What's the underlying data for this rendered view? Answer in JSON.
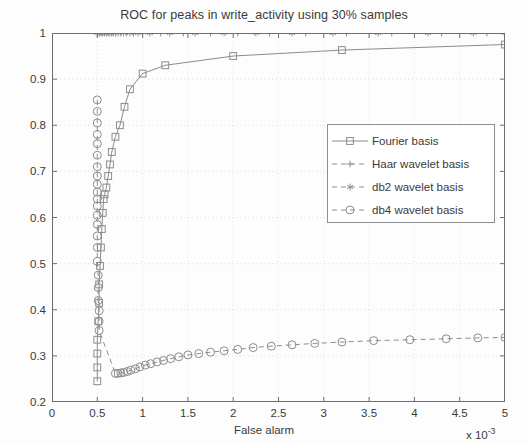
{
  "chart_data": {
    "type": "line",
    "title": "ROC for peaks in write_activity using 30% samples",
    "xlabel": "False alarm",
    "ylabel": "Hit rate",
    "x_exponent_prefix": "x 10",
    "x_exponent_power": "-3",
    "xlim": [
      0,
      5
    ],
    "ylim": [
      0.2,
      1
    ],
    "xticks": [
      0,
      0.5,
      1,
      1.5,
      2,
      2.5,
      3,
      3.5,
      4,
      4.5,
      5
    ],
    "xtick_labels": [
      "0",
      "0.5",
      "1",
      "1.5",
      "2",
      "2.5",
      "3",
      "3.5",
      "4",
      "4.5",
      "5"
    ],
    "yticks": [
      0.2,
      0.3,
      0.4,
      0.5,
      0.6,
      0.7,
      0.8,
      0.9,
      1
    ],
    "ytick_labels": [
      "0.2",
      "0.3",
      "0.4",
      "0.5",
      "0.6",
      "0.7",
      "0.8",
      "0.9",
      "1"
    ],
    "grid": true,
    "legend_position": "center-right",
    "line_color": "#8c8c8c",
    "axis_color": "#6e6e6e",
    "grid_color": "#d7d7d7",
    "series": [
      {
        "name": "Fourier basis",
        "marker": "square",
        "linestyle": "solid",
        "color": "#8c8c8c",
        "points": [
          [
            0.5,
            0.245
          ],
          [
            0.5,
            0.275
          ],
          [
            0.5,
            0.305
          ],
          [
            0.5,
            0.335
          ],
          [
            0.51,
            0.375
          ],
          [
            0.52,
            0.415
          ],
          [
            0.52,
            0.455
          ],
          [
            0.53,
            0.495
          ],
          [
            0.54,
            0.535
          ],
          [
            0.55,
            0.575
          ],
          [
            0.56,
            0.61
          ],
          [
            0.57,
            0.64
          ],
          [
            0.58,
            0.65
          ],
          [
            0.6,
            0.665
          ],
          [
            0.62,
            0.69
          ],
          [
            0.64,
            0.715
          ],
          [
            0.66,
            0.742
          ],
          [
            0.7,
            0.775
          ],
          [
            0.75,
            0.8
          ],
          [
            0.8,
            0.84
          ],
          [
            0.86,
            0.878
          ],
          [
            1.0,
            0.912
          ],
          [
            1.25,
            0.93
          ],
          [
            2.0,
            0.95
          ],
          [
            3.2,
            0.963
          ],
          [
            5.0,
            0.975
          ]
        ]
      },
      {
        "name": "Haar wavelet basis",
        "marker": "plus",
        "linestyle": "dashed",
        "color": "#8c8c8c",
        "points": [
          [
            0.5,
            1.0
          ],
          [
            0.52,
            1.0
          ],
          [
            0.55,
            1.0
          ],
          [
            0.58,
            1.0
          ],
          [
            0.62,
            1.0
          ],
          [
            0.66,
            1.0
          ],
          [
            0.7,
            1.0
          ],
          [
            0.76,
            1.0
          ],
          [
            0.82,
            1.0
          ],
          [
            0.9,
            1.0
          ],
          [
            1.0,
            1.0
          ],
          [
            1.2,
            1.0
          ],
          [
            1.45,
            1.0
          ],
          [
            1.75,
            1.0
          ],
          [
            2.05,
            1.0
          ],
          [
            2.4,
            1.0
          ],
          [
            2.8,
            1.0
          ],
          [
            3.25,
            1.0
          ],
          [
            3.75,
            1.0
          ],
          [
            4.3,
            1.0
          ],
          [
            4.8,
            1.0
          ],
          [
            5.0,
            1.0
          ]
        ]
      },
      {
        "name": "db2 wavelet basis",
        "marker": "asterisk",
        "linestyle": "dashed",
        "color": "#8c8c8c",
        "points": [
          [
            0.5,
            1.0
          ],
          [
            0.53,
            1.0
          ],
          [
            0.56,
            1.0
          ],
          [
            0.6,
            1.0
          ],
          [
            0.64,
            1.0
          ],
          [
            0.68,
            1.0
          ],
          [
            0.73,
            1.0
          ],
          [
            0.79,
            1.0
          ],
          [
            0.86,
            1.0
          ],
          [
            0.95,
            1.0
          ],
          [
            1.08,
            1.0
          ],
          [
            1.3,
            1.0
          ],
          [
            1.58,
            1.0
          ],
          [
            1.9,
            1.0
          ],
          [
            2.25,
            1.0
          ],
          [
            2.65,
            1.0
          ],
          [
            3.1,
            1.0
          ],
          [
            3.6,
            1.0
          ],
          [
            4.15,
            1.0
          ],
          [
            4.65,
            1.0
          ],
          [
            5.0,
            1.0
          ]
        ]
      },
      {
        "name": "db4 wavelet basis",
        "marker": "circle",
        "linestyle": "dashed",
        "color": "#8c8c8c",
        "points": [
          [
            0.5,
            0.855
          ],
          [
            0.5,
            0.83
          ],
          [
            0.5,
            0.805
          ],
          [
            0.5,
            0.78
          ],
          [
            0.5,
            0.76
          ],
          [
            0.5,
            0.735
          ],
          [
            0.5,
            0.71
          ],
          [
            0.5,
            0.69
          ],
          [
            0.5,
            0.672
          ],
          [
            0.5,
            0.655
          ],
          [
            0.5,
            0.64
          ],
          [
            0.5,
            0.625
          ],
          [
            0.5,
            0.605
          ],
          [
            0.5,
            0.585
          ],
          [
            0.5,
            0.56
          ],
          [
            0.5,
            0.535
          ],
          [
            0.5,
            0.505
          ],
          [
            0.51,
            0.475
          ],
          [
            0.51,
            0.448
          ],
          [
            0.51,
            0.42
          ],
          [
            0.52,
            0.398
          ],
          [
            0.52,
            0.375
          ],
          [
            0.52,
            0.355
          ],
          [
            0.7,
            0.262
          ],
          [
            0.73,
            0.262
          ],
          [
            0.76,
            0.263
          ],
          [
            0.79,
            0.264
          ],
          [
            0.83,
            0.266
          ],
          [
            0.87,
            0.269
          ],
          [
            0.92,
            0.272
          ],
          [
            0.97,
            0.276
          ],
          [
            1.03,
            0.28
          ],
          [
            1.09,
            0.283
          ],
          [
            1.16,
            0.287
          ],
          [
            1.23,
            0.29
          ],
          [
            1.31,
            0.294
          ],
          [
            1.4,
            0.298
          ],
          [
            1.5,
            0.302
          ],
          [
            1.62,
            0.305
          ],
          [
            1.75,
            0.308
          ],
          [
            1.9,
            0.311
          ],
          [
            2.05,
            0.314
          ],
          [
            2.22,
            0.318
          ],
          [
            2.42,
            0.321
          ],
          [
            2.65,
            0.324
          ],
          [
            2.9,
            0.327
          ],
          [
            3.2,
            0.33
          ],
          [
            3.55,
            0.333
          ],
          [
            3.95,
            0.335
          ],
          [
            4.35,
            0.337
          ],
          [
            4.7,
            0.339
          ],
          [
            5.0,
            0.34
          ]
        ]
      }
    ]
  },
  "legend": {
    "items": [
      {
        "label": "Fourier basis",
        "marker": "square",
        "linestyle": "solid"
      },
      {
        "label": "Haar wavelet basis",
        "marker": "plus",
        "linestyle": "dashed"
      },
      {
        "label": "db2 wavelet basis",
        "marker": "asterisk",
        "linestyle": "dashed"
      },
      {
        "label": "db4 wavelet basis",
        "marker": "circle",
        "linestyle": "dashed"
      }
    ]
  }
}
